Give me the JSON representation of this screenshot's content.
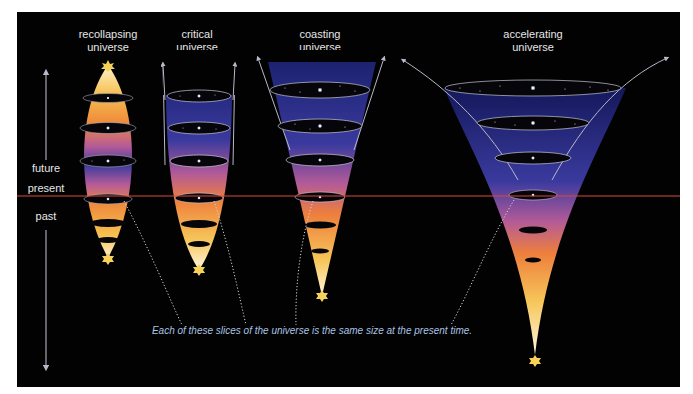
{
  "title_labels": {
    "recollapsing": [
      "recollapsing",
      "universe"
    ],
    "critical": [
      "critical",
      "universe"
    ],
    "coasting": [
      "coasting",
      "universe"
    ],
    "accelerating": [
      "accelerating",
      "universe"
    ]
  },
  "time_axis": {
    "future": "future",
    "present": "present",
    "past": "past"
  },
  "caption": "Each of these slices of the universe is the same size at the present time.",
  "colors": {
    "background": "#020203",
    "present_line": "#d9483a",
    "label_text": "#e6e6e6",
    "caption_text": "#a9c4e4",
    "gradient_top": "#2a2f8c",
    "gradient_mid": "#b85a9a",
    "gradient_orange": "#f08a3a",
    "gradient_yellow": "#f6c65a",
    "gradient_bottom": "#fff5d8"
  },
  "models": [
    {
      "name": "recollapsing universe",
      "shape": "lens",
      "slices": 6
    },
    {
      "name": "critical universe",
      "shape": "open-bowl",
      "slices": 6
    },
    {
      "name": "coasting universe",
      "shape": "cone",
      "slices": 5
    },
    {
      "name": "accelerating universe",
      "shape": "trumpet",
      "slices": 6
    }
  ]
}
